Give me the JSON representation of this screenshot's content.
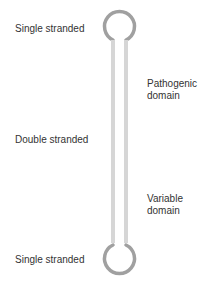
{
  "labels": {
    "top": "Single stranded",
    "middle": "Double stranded",
    "bottom": "Single stranded",
    "pathogenic_line1": "Pathogenic",
    "pathogenic_line2": "domain",
    "variable_line1": "Variable",
    "variable_line2": "domain"
  },
  "colors": {
    "loop": "#a0a0a0",
    "stem": "#d6d6d6",
    "text": "#333333"
  }
}
